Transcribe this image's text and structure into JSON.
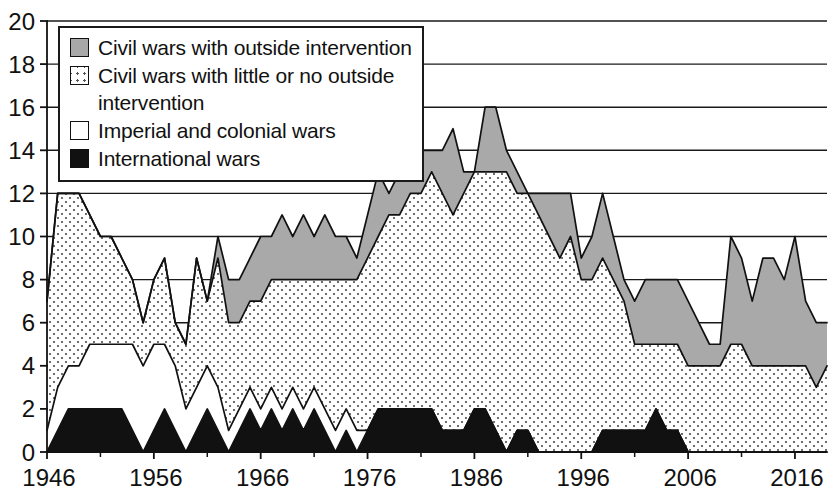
{
  "chart_data": {
    "type": "area",
    "title": "",
    "subtitle": "",
    "xlabel": "",
    "ylabel": "",
    "stacked": true,
    "grid": true,
    "grid_axis": "y",
    "legend_position": "top-left",
    "xlim": [
      1946,
      2019
    ],
    "ylim": [
      0,
      20
    ],
    "ytick_step": 2,
    "xtick_step": 5,
    "y_ticks": [
      0,
      2,
      4,
      6,
      8,
      10,
      12,
      14,
      16,
      18,
      20
    ],
    "y_tick_labels": [
      "0",
      "2",
      "4",
      "6",
      "8",
      "10",
      "12",
      "14",
      "16",
      "18",
      "20"
    ],
    "x_tick_labels": [
      "1946",
      "1956",
      "1966",
      "1976",
      "1986",
      "1996",
      "2006",
      "2016"
    ],
    "x_tick_values": [
      1946,
      1956,
      1966,
      1976,
      1986,
      1996,
      2006,
      2016
    ],
    "x_minor_tick_values": [
      1951,
      1961,
      1971,
      1981,
      1991,
      2001,
      2011
    ],
    "x": [
      1946,
      1947,
      1948,
      1949,
      1950,
      1951,
      1952,
      1953,
      1954,
      1955,
      1956,
      1957,
      1958,
      1959,
      1960,
      1961,
      1962,
      1963,
      1964,
      1965,
      1966,
      1967,
      1968,
      1969,
      1970,
      1971,
      1972,
      1973,
      1974,
      1975,
      1976,
      1977,
      1978,
      1979,
      1980,
      1981,
      1982,
      1983,
      1984,
      1985,
      1986,
      1987,
      1988,
      1989,
      1990,
      1991,
      1992,
      1993,
      1994,
      1995,
      1996,
      1997,
      1998,
      1999,
      2000,
      2001,
      2002,
      2003,
      2004,
      2005,
      2006,
      2007,
      2008,
      2009,
      2010,
      2011,
      2012,
      2013,
      2014,
      2015,
      2016,
      2017,
      2018,
      2019
    ],
    "series": [
      {
        "name": "International wars",
        "key": "international",
        "color": "#111111",
        "pattern": "solid-black",
        "stack_order": 1,
        "values": [
          0,
          1,
          2,
          2,
          2,
          2,
          2,
          2,
          1,
          0,
          1,
          2,
          1,
          0,
          1,
          2,
          1,
          0,
          1,
          2,
          1,
          2,
          1,
          2,
          1,
          2,
          1,
          0,
          1,
          0,
          1,
          2,
          2,
          2,
          2,
          2,
          2,
          1,
          1,
          1,
          2,
          2,
          1,
          0,
          1,
          1,
          0,
          0,
          0,
          0,
          0,
          0,
          1,
          1,
          1,
          1,
          1,
          2,
          1,
          1,
          0,
          0,
          0,
          0,
          0,
          0,
          0,
          0,
          0,
          0,
          0,
          0,
          0,
          0
        ]
      },
      {
        "name": "Imperial and colonial wars",
        "key": "imperial",
        "color": "#ffffff",
        "pattern": "plain-white",
        "stack_order": 2,
        "values": [
          1,
          2,
          2,
          2,
          3,
          3,
          3,
          3,
          4,
          4,
          4,
          3,
          3,
          2,
          2,
          2,
          2,
          1,
          1,
          1,
          1,
          1,
          1,
          1,
          1,
          1,
          1,
          1,
          1,
          1,
          0,
          0,
          0,
          0,
          0,
          0,
          0,
          0,
          0,
          0,
          0,
          0,
          0,
          0,
          0,
          0,
          0,
          0,
          0,
          0,
          0,
          0,
          0,
          0,
          0,
          0,
          0,
          0,
          0,
          0,
          0,
          0,
          0,
          0,
          0,
          0,
          0,
          0,
          0,
          0,
          0,
          0,
          0,
          0
        ]
      },
      {
        "name": "Civil wars with little or no outside intervention",
        "key": "civil_no_intervention",
        "color": "#ffffff",
        "pattern": "dotted",
        "stack_order": 3,
        "values": [
          6,
          9,
          8,
          8,
          6,
          5,
          5,
          4,
          3,
          2,
          3,
          4,
          2,
          3,
          6,
          3,
          6,
          5,
          4,
          4,
          5,
          5,
          6,
          5,
          6,
          5,
          6,
          7,
          6,
          7,
          8,
          8,
          9,
          9,
          10,
          10,
          11,
          11,
          10,
          11,
          11,
          11,
          12,
          13,
          11,
          11,
          11,
          10,
          9,
          10,
          8,
          8,
          8,
          7,
          6,
          4,
          4,
          3,
          4,
          4,
          4,
          4,
          4,
          4,
          5,
          5,
          4,
          4,
          4,
          4,
          4,
          4,
          3,
          4
        ]
      },
      {
        "name": "Civil wars with outside intervention",
        "key": "civil_with_intervention",
        "color": "#a8a8a8",
        "pattern": "solid-gray",
        "stack_order": 4,
        "values": [
          0,
          0,
          0,
          0,
          0,
          0,
          0,
          0,
          0,
          0,
          0,
          0,
          0,
          0,
          0,
          0,
          1,
          2,
          2,
          2,
          3,
          2,
          3,
          2,
          3,
          2,
          3,
          2,
          2,
          1,
          2,
          3,
          1,
          2,
          3,
          2,
          1,
          2,
          4,
          1,
          0,
          3,
          3,
          1,
          1,
          0,
          1,
          2,
          3,
          2,
          1,
          2,
          3,
          2,
          1,
          2,
          3,
          3,
          3,
          3,
          3,
          2,
          1,
          1,
          5,
          4,
          3,
          5,
          5,
          4,
          6,
          3,
          3,
          2
        ]
      }
    ],
    "totals": [
      7,
      12,
      12,
      12,
      11,
      10,
      10,
      9,
      8,
      6,
      8,
      9,
      6,
      5,
      9,
      7,
      10,
      8,
      8,
      9,
      10,
      10,
      11,
      10,
      11,
      10,
      11,
      10,
      10,
      9,
      11,
      13,
      12,
      13,
      15,
      14,
      14,
      14,
      15,
      13,
      13,
      16,
      16,
      14,
      13,
      12,
      12,
      12,
      12,
      12,
      9,
      10,
      12,
      10,
      8,
      7,
      8,
      8,
      8,
      8,
      7,
      6,
      5,
      5,
      10,
      9,
      7,
      9,
      9,
      8,
      10,
      7,
      6,
      6
    ]
  },
  "legend": {
    "items": [
      {
        "label": "Civil wars with outside intervention",
        "swatch": "solid-gray"
      },
      {
        "label": "Civil wars with little or no outside\nintervention",
        "swatch": "dotted"
      },
      {
        "label": "Imperial and colonial wars",
        "swatch": "plain-white"
      },
      {
        "label": "International wars",
        "swatch": "solid-black"
      }
    ]
  }
}
